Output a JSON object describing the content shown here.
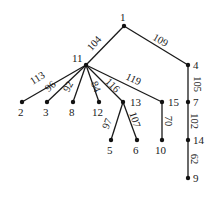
{
  "diagram": {
    "type": "weighted-tree",
    "nodes": [
      {
        "id": "1",
        "x": 124,
        "y": 26,
        "lx": 120,
        "ly": 21,
        "anchor": "start"
      },
      {
        "id": "11",
        "x": 86,
        "y": 65,
        "lx": 72,
        "ly": 62,
        "anchor": "start"
      },
      {
        "id": "4",
        "x": 188,
        "y": 65,
        "lx": 193,
        "ly": 69,
        "anchor": "start"
      },
      {
        "id": "2",
        "x": 22,
        "y": 102,
        "lx": 18,
        "ly": 116,
        "anchor": "start"
      },
      {
        "id": "3",
        "x": 47,
        "y": 102,
        "lx": 43,
        "ly": 116,
        "anchor": "start"
      },
      {
        "id": "8",
        "x": 73,
        "y": 102,
        "lx": 69,
        "ly": 116,
        "anchor": "start"
      },
      {
        "id": "12",
        "x": 99,
        "y": 102,
        "lx": 92,
        "ly": 116,
        "anchor": "start"
      },
      {
        "id": "13",
        "x": 123,
        "y": 102,
        "lx": 130,
        "ly": 106,
        "anchor": "start"
      },
      {
        "id": "15",
        "x": 162,
        "y": 102,
        "lx": 168,
        "ly": 106,
        "anchor": "start"
      },
      {
        "id": "7",
        "x": 188,
        "y": 102,
        "lx": 193,
        "ly": 106,
        "anchor": "start"
      },
      {
        "id": "5",
        "x": 111,
        "y": 140,
        "lx": 107,
        "ly": 154,
        "anchor": "start"
      },
      {
        "id": "6",
        "x": 137,
        "y": 140,
        "lx": 133,
        "ly": 154,
        "anchor": "start"
      },
      {
        "id": "10",
        "x": 162,
        "y": 140,
        "lx": 155,
        "ly": 154,
        "anchor": "start"
      },
      {
        "id": "14",
        "x": 188,
        "y": 140,
        "lx": 193,
        "ly": 144,
        "anchor": "start"
      },
      {
        "id": "9",
        "x": 188,
        "y": 178,
        "lx": 193,
        "ly": 182,
        "anchor": "start"
      }
    ],
    "edges": [
      {
        "from": "1",
        "to": "11",
        "weight": "104",
        "lx": 95,
        "ly": 44,
        "rot": -48
      },
      {
        "from": "1",
        "to": "4",
        "weight": "109",
        "lx": 160,
        "ly": 41,
        "rot": 30
      },
      {
        "from": "11",
        "to": "2",
        "weight": "113",
        "lx": 38,
        "ly": 79,
        "rot": -32
      },
      {
        "from": "11",
        "to": "3",
        "weight": "96",
        "lx": 51,
        "ly": 87,
        "rot": -40
      },
      {
        "from": "11",
        "to": "8",
        "weight": "92",
        "lx": 69,
        "ly": 87,
        "rot": -62
      },
      {
        "from": "11",
        "to": "12",
        "weight": "84",
        "lx": 95,
        "ly": 87,
        "rot": 68
      },
      {
        "from": "11",
        "to": "13",
        "weight": "116",
        "lx": 112,
        "ly": 86,
        "rot": 45
      },
      {
        "from": "11",
        "to": "15",
        "weight": "119",
        "lx": 133,
        "ly": 80,
        "rot": 25
      },
      {
        "from": "4",
        "to": "7",
        "weight": "105",
        "lx": 196,
        "ly": 84,
        "rot": 90
      },
      {
        "from": "13",
        "to": "5",
        "weight": "97",
        "lx": 108,
        "ly": 124,
        "rot": -68
      },
      {
        "from": "13",
        "to": "6",
        "weight": "107",
        "lx": 134,
        "ly": 120,
        "rot": 72
      },
      {
        "from": "15",
        "to": "10",
        "weight": "70",
        "lx": 167,
        "ly": 121,
        "rot": 90
      },
      {
        "from": "7",
        "to": "14",
        "weight": "102",
        "lx": 193,
        "ly": 121,
        "rot": 90
      },
      {
        "from": "14",
        "to": "9",
        "weight": "62",
        "lx": 193,
        "ly": 159,
        "rot": 90
      }
    ]
  }
}
